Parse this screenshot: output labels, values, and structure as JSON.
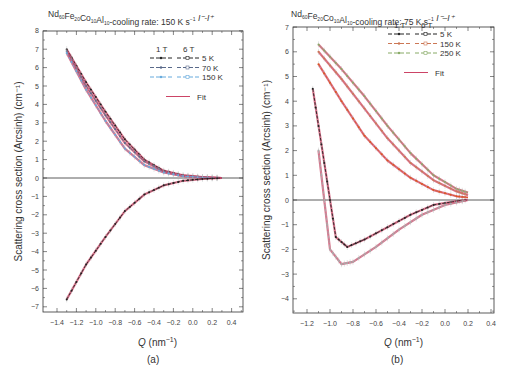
{
  "chart_data": [
    {
      "type": "line",
      "panel": "(a)",
      "title": "Nd60Fe20Co10Al10-cooling rate: 150 K s^-1  I^- - I^+",
      "title_parts": {
        "base": "Nd",
        "s1": "60",
        "fe": "Fe",
        "s2": "20",
        "co": "Co",
        "s3": "10",
        "al": "Al",
        "s4": "10",
        "rest": "-cooling rate: 150 K s",
        "sup": "−1",
        "tail": "  I⁻-I⁺"
      },
      "xlabel": "Q (nm⁻¹)",
      "xlabel_parts": {
        "q": "Q",
        "unit": " (nm",
        "sup": "−1",
        "close": ")"
      },
      "ylabel": "Scattering cross section (Arcsinh) (cm⁻¹)",
      "xlim": [
        -1.55,
        0.45
      ],
      "ylim": [
        -7.8,
        8
      ],
      "xticks": [
        "-1.4",
        "-1.2",
        "-1.0",
        "-0.8",
        "-0.6",
        "-0.4",
        "-0.2",
        "0.0",
        "0.2",
        "0.4"
      ],
      "yticks": [
        "8",
        "7",
        "6",
        "5",
        "4",
        "3",
        "2",
        "1",
        "0",
        "-1",
        "-2",
        "-3",
        "-4",
        "-5",
        "-6",
        "-7"
      ],
      "legend": {
        "header": [
          "1 T",
          "6 T"
        ],
        "entries": [
          "5 K",
          "70 K",
          "150 K"
        ],
        "fit": "Fit"
      },
      "series": [
        {
          "name": "5 K 1T (upper branch)",
          "color": "#222222",
          "x": [
            -1.3,
            -1.1,
            -0.9,
            -0.7,
            -0.5,
            -0.3,
            -0.1,
            0.1,
            0.3
          ],
          "y": [
            7.0,
            5.2,
            3.6,
            2.1,
            1.0,
            0.4,
            0.15,
            0.05,
            0.0
          ]
        },
        {
          "name": "70 K",
          "color": "#5a6a8a",
          "x": [
            -1.3,
            -1.1,
            -0.9,
            -0.7,
            -0.5,
            -0.3,
            -0.1,
            0.1,
            0.3
          ],
          "y": [
            6.9,
            5.0,
            3.4,
            1.9,
            0.9,
            0.35,
            0.12,
            0.04,
            0.0
          ]
        },
        {
          "name": "150 K",
          "color": "#66aadd",
          "x": [
            -1.3,
            -1.1,
            -0.9,
            -0.7,
            -0.5,
            -0.3,
            -0.1,
            0.1,
            0.3
          ],
          "y": [
            6.8,
            4.8,
            3.1,
            1.6,
            0.7,
            0.3,
            0.1,
            0.03,
            0.0
          ]
        },
        {
          "name": "5 K (lower branch)",
          "color": "#222222",
          "x": [
            -1.3,
            -1.1,
            -0.9,
            -0.7,
            -0.5,
            -0.3,
            -0.1,
            0.1,
            0.3
          ],
          "y": [
            -6.6,
            -4.7,
            -3.2,
            -1.8,
            -0.9,
            -0.4,
            -0.15,
            -0.05,
            0.0
          ]
        },
        {
          "name": "Fit",
          "color": "#cc4466"
        }
      ]
    },
    {
      "type": "line",
      "panel": "(b)",
      "title": "Nd60Fe20Co10Al10-cooling rate: 75 K s^-1  I^- - I^+",
      "title_parts": {
        "base": "Nd",
        "s1": "60",
        "fe": "Fe",
        "s2": "20",
        "co": "Co",
        "s3": "10",
        "al": "Al",
        "s4": "10",
        "rest": "-cooling rate: 75 K s",
        "sup": "−1",
        "tail": "  I⁻–I⁺"
      },
      "xlabel": "Q (nm⁻¹)",
      "xlabel_parts": {
        "q": "Q",
        "unit": " (nm",
        "sup": "−1",
        "close": ")"
      },
      "ylabel": "Scattering cross section (Arcsinh) (cm⁻¹)",
      "xlim": [
        -1.33,
        0.42
      ],
      "ylim": [
        -4.6,
        7
      ],
      "xticks": [
        "-1.2",
        "-1.0",
        "-0.8",
        "-0.6",
        "-0.4",
        "-0.2",
        "0.0",
        "0.2",
        "0.4"
      ],
      "yticks": [
        "7",
        "6",
        "5",
        "4",
        "3",
        "2",
        "1",
        "0",
        "-1",
        "-2",
        "-3",
        "-4"
      ],
      "legend": {
        "header": [
          "1 T",
          "6 T"
        ],
        "entries": [
          "5 K",
          "150 K",
          "250 K"
        ],
        "fit": "Fit"
      },
      "series": [
        {
          "name": "250 K 6T",
          "color": "#88aa66",
          "x": [
            -1.1,
            -0.9,
            -0.7,
            -0.5,
            -0.3,
            -0.1,
            0.1,
            0.2
          ],
          "y": [
            6.3,
            5.3,
            4.2,
            3.0,
            1.9,
            1.0,
            0.45,
            0.3
          ]
        },
        {
          "name": "150 K 6T",
          "color": "#cc7755",
          "x": [
            -1.1,
            -0.9,
            -0.7,
            -0.5,
            -0.3,
            -0.1,
            0.1,
            0.2
          ],
          "y": [
            6.0,
            4.9,
            3.7,
            2.5,
            1.5,
            0.8,
            0.35,
            0.2
          ]
        },
        {
          "name": "150 K 1T",
          "color": "#dd5522",
          "x": [
            -1.1,
            -0.9,
            -0.7,
            -0.5,
            -0.3,
            -0.1,
            0.1,
            0.2
          ],
          "y": [
            5.5,
            4.0,
            2.6,
            1.6,
            0.9,
            0.4,
            0.15,
            0.1
          ]
        },
        {
          "name": "5 K 1T",
          "color": "#222222",
          "x": [
            -1.15,
            -1.05,
            -0.95,
            -0.85,
            -0.7,
            -0.5,
            -0.3,
            -0.1,
            0.1,
            0.2
          ],
          "y": [
            4.5,
            1.5,
            -1.5,
            -1.9,
            -1.6,
            -1.1,
            -0.6,
            -0.2,
            -0.05,
            0.0
          ]
        },
        {
          "name": "5 K 6T",
          "color": "#aaaaaa",
          "x": [
            -1.1,
            -1.0,
            -0.9,
            -0.8,
            -0.6,
            -0.4,
            -0.2,
            0.0,
            0.2
          ],
          "y": [
            2.0,
            -2.0,
            -2.6,
            -2.5,
            -1.9,
            -1.2,
            -0.6,
            -0.2,
            0.0
          ]
        },
        {
          "name": "Fit",
          "color": "#cc4466"
        }
      ]
    }
  ]
}
